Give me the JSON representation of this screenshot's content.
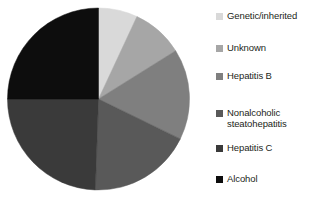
{
  "chart_data": {
    "type": "pie",
    "title": "",
    "subtitle": "",
    "xlabel": "",
    "ylabel": "",
    "legend_position": "right",
    "grid": false,
    "start_angle_deg": 0,
    "direction": "clockwise",
    "categories": [
      "Genetic/inherited",
      "Unknown",
      "Hepatitis B",
      "Nonalcoholic steatohepatitis",
      "Hepatitis C",
      "Alcohol"
    ],
    "values": [
      7,
      9,
      16,
      18,
      25,
      25
    ],
    "angles_deg": [
      25,
      33,
      58,
      66,
      88,
      90
    ],
    "colors": [
      "#d9d9d9",
      "#a6a6a6",
      "#7f7f7f",
      "#595959",
      "#3a3a3a",
      "#0d0d0d"
    ],
    "slices": [
      {
        "label": "Genetic/inherited",
        "value": 7,
        "angle_deg": 25,
        "color": "#d9d9d9"
      },
      {
        "label": "Unknown",
        "value": 9,
        "angle_deg": 33,
        "color": "#a6a6a6"
      },
      {
        "label": "Hepatitis B",
        "value": 16,
        "angle_deg": 58,
        "color": "#7f7f7f"
      },
      {
        "label": "Nonalcoholic steatohepatitis",
        "value": 18,
        "angle_deg": 66,
        "color": "#595959"
      },
      {
        "label": "Hepatitis C",
        "value": 25,
        "angle_deg": 88,
        "color": "#3a3a3a"
      },
      {
        "label": "Alcohol",
        "value": 25,
        "angle_deg": 90,
        "color": "#0d0d0d"
      }
    ]
  },
  "legend": {
    "items": [
      {
        "label": "Genetic/inherited",
        "color": "#d9d9d9",
        "top": 11
      },
      {
        "label": "Unknown",
        "color": "#a6a6a6",
        "top": 43
      },
      {
        "label": "Hepatitis B",
        "color": "#7f7f7f",
        "top": 71
      },
      {
        "label": "Nonalcoholic\nsteatohepatitis",
        "color": "#595959",
        "top": 108
      },
      {
        "label": "Hepatitis C",
        "color": "#3a3a3a",
        "top": 143
      },
      {
        "label": "Alcohol",
        "color": "#0d0d0d",
        "top": 174
      }
    ]
  }
}
